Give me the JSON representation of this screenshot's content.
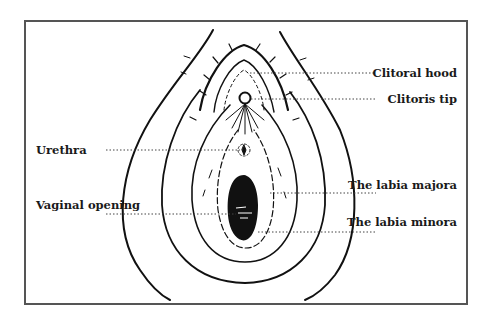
{
  "diagram": {
    "colors": {
      "ink": "#111111",
      "frame": "#555555",
      "background": "#ffffff"
    },
    "labels": {
      "clitoral_hood": "Clitoral hood",
      "clitoris_tip": "Clitoris tip",
      "urethra": "Urethra",
      "vaginal_opening": "Vaginal opening",
      "labia_majora": "The labia majora",
      "labia_minora": "The labia minora"
    }
  }
}
